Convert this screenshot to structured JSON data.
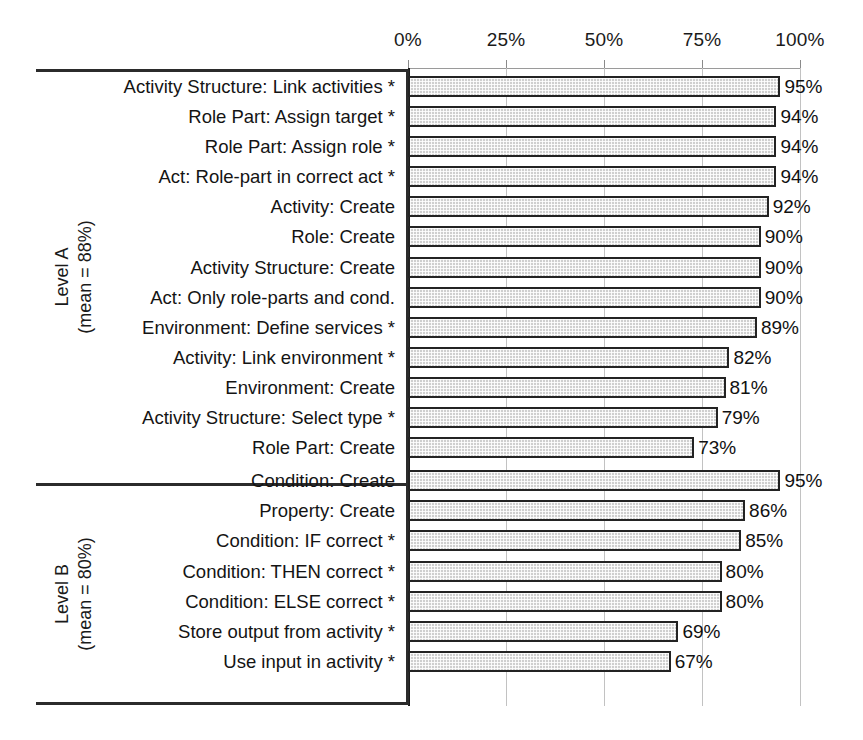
{
  "chart_data": {
    "type": "bar",
    "orientation": "horizontal",
    "title": "",
    "xlabel": "",
    "ylabel": "",
    "xlim": [
      0,
      100
    ],
    "grid": true,
    "legend": "none",
    "value_suffix": "%",
    "axis": {
      "ticks": [
        0,
        25,
        50,
        75,
        100
      ],
      "tick_labels": [
        "0%",
        "25%",
        "50%",
        "75%",
        "100%"
      ],
      "position": "top"
    },
    "groups": [
      {
        "name": "Level A",
        "label_line1": "Level A",
        "label_line2": "(mean = 88%)",
        "mean": 88,
        "categories": [
          "Activity Structure: Link activities *",
          "Role Part: Assign target *",
          "Role Part: Assign role *",
          "Act: Role-part in correct act *",
          "Activity: Create",
          "Role: Create",
          "Activity Structure: Create",
          "Act: Only role-parts and cond.",
          "Environment: Define services *",
          "Activity: Link environment *",
          "Environment: Create",
          "Activity Structure: Select type *",
          "Role Part: Create"
        ],
        "values": [
          95,
          94,
          94,
          94,
          92,
          90,
          90,
          90,
          89,
          82,
          81,
          79,
          73
        ],
        "value_labels": [
          "95%",
          "94%",
          "94%",
          "94%",
          "92%",
          "90%",
          "90%",
          "90%",
          "89%",
          "82%",
          "81%",
          "79%",
          "73%"
        ]
      },
      {
        "name": "Level B",
        "label_line1": "Level B",
        "label_line2": "(mean = 80%)",
        "mean": 80,
        "categories": [
          "Condition: Create",
          "Property: Create",
          "Condition: IF correct *",
          "Condition: THEN correct *",
          "Condition: ELSE correct *",
          "Store output from activity *",
          "Use input in activity *"
        ],
        "values": [
          95,
          86,
          85,
          80,
          80,
          69,
          67
        ],
        "value_labels": [
          "95%",
          "86%",
          "85%",
          "80%",
          "80%",
          "69%",
          "67%"
        ]
      }
    ],
    "colors": {
      "bar_fill": "#cfcfcf",
      "bar_border": "#232323",
      "gridline": "#c2c2c2",
      "axis": "#9a9a9a",
      "rule": "#2b2b2b",
      "text": "#141414",
      "background": "#ffffff"
    }
  }
}
